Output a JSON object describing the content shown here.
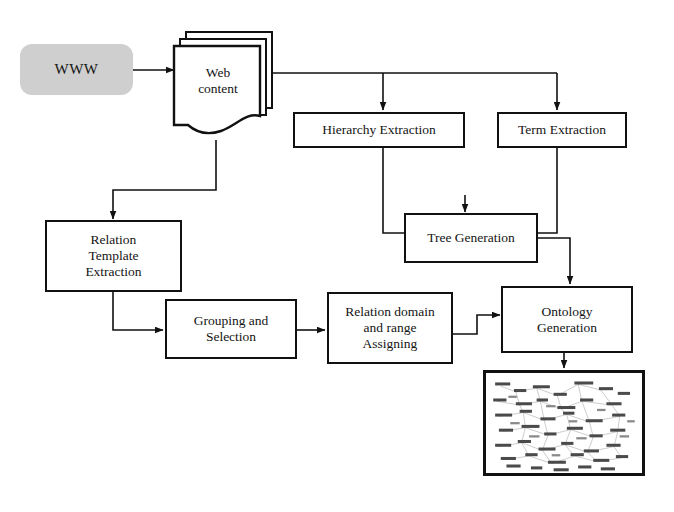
{
  "diagram": {
    "background_color": "#ffffff",
    "line_color": "#111111",
    "accent_fill": "#cfcfcf",
    "nodes": [
      {
        "id": "www",
        "label": "WWW",
        "shape": "rounded-rectangle",
        "fill": "#cfcfcf"
      },
      {
        "id": "web-content",
        "label_line1": "Web",
        "label_line2": "content",
        "shape": "document-stack",
        "fill": "#ffffff"
      },
      {
        "id": "hierarchy-extraction",
        "label": "Hierarchy  Extraction",
        "shape": "rectangle",
        "fill": "#ffffff"
      },
      {
        "id": "term-extraction",
        "label": "Term Extraction",
        "shape": "rectangle",
        "fill": "#ffffff"
      },
      {
        "id": "relation-template-extraction",
        "label_line1": "Relation",
        "label_line2": "Template",
        "label_line3": "Extraction",
        "shape": "rectangle",
        "fill": "#ffffff"
      },
      {
        "id": "tree-generation",
        "label": "Tree Generation",
        "shape": "rectangle",
        "fill": "#ffffff"
      },
      {
        "id": "grouping-and-selection",
        "label_line1": "Grouping  and",
        "label_line2": "Selection",
        "shape": "rectangle",
        "fill": "#ffffff"
      },
      {
        "id": "relation-domain-range-assigning",
        "label_line1": "Relation domain",
        "label_line2": "and range",
        "label_line3": "Assigning",
        "shape": "rectangle",
        "fill": "#ffffff"
      },
      {
        "id": "ontology-generation",
        "label_line1": "Ontology",
        "label_line2": "Generation",
        "shape": "rectangle",
        "fill": "#ffffff"
      },
      {
        "id": "ontology-graph-output",
        "label": "",
        "shape": "image-thumbnail",
        "description": "dense ontology node-link graph thumbnail",
        "fill": "#ffffff"
      }
    ],
    "edges": [
      {
        "from": "www",
        "to": "web-content",
        "style": "arrow"
      },
      {
        "from": "web-content",
        "to": "hierarchy-extraction",
        "style": "arrow"
      },
      {
        "from": "web-content",
        "to": "term-extraction",
        "style": "arrow"
      },
      {
        "from": "web-content",
        "to": "relation-template-extraction",
        "style": "arrow"
      },
      {
        "from": "hierarchy-extraction",
        "to": "tree-generation",
        "style": "arrow"
      },
      {
        "from": "term-extraction",
        "to": "tree-generation",
        "style": "arrow"
      },
      {
        "from": "relation-template-extraction",
        "to": "grouping-and-selection",
        "style": "arrow"
      },
      {
        "from": "grouping-and-selection",
        "to": "relation-domain-range-assigning",
        "style": "arrow"
      },
      {
        "from": "relation-domain-range-assigning",
        "to": "ontology-generation",
        "style": "arrow"
      },
      {
        "from": "tree-generation",
        "to": "ontology-generation",
        "style": "arrow"
      },
      {
        "from": "ontology-generation",
        "to": "ontology-graph-output",
        "style": "arrow"
      }
    ]
  }
}
